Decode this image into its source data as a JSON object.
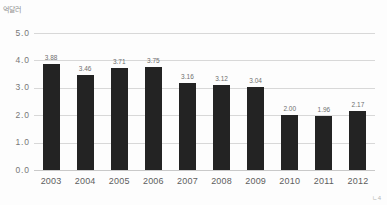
{
  "chart_data": {
    "type": "bar",
    "title": "",
    "xlabel": "",
    "ylabel": "억달러",
    "ylim": [
      0.0,
      5.0
    ],
    "ytick_labels": [
      "5.0",
      "4.0",
      "3.0",
      "2.0",
      "1.0",
      "0.0"
    ],
    "ytick_values": [
      5.0,
      4.0,
      3.0,
      2.0,
      1.0,
      0.0
    ],
    "grid": true,
    "legend": "none",
    "categories": [
      "2003",
      "2004",
      "2005",
      "2006",
      "2007",
      "2008",
      "2009",
      "2010",
      "2011",
      "2012"
    ],
    "values": [
      3.88,
      3.46,
      3.71,
      3.75,
      3.16,
      3.12,
      3.04,
      2.0,
      1.96,
      2.17
    ],
    "data_labels": [
      "3.88",
      "3.46",
      "3.71",
      "3.75",
      "3.16",
      "3.12",
      "3.04",
      "2.00",
      "1.96",
      "2.17"
    ],
    "bar_color": "#232323",
    "grid_color": "#d8d8d8"
  },
  "corner": {
    "mark": "ㄴ4"
  }
}
